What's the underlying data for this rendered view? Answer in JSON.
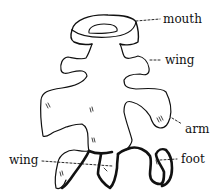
{
  "figure": {
    "colors": {
      "stroke": "#111111",
      "background": "#ffffff"
    },
    "labels": [
      {
        "id": "mouth",
        "text": "mouth",
        "x": 163,
        "y": 13
      },
      {
        "id": "wing_upper",
        "text": "wing",
        "x": 165,
        "y": 54
      },
      {
        "id": "arm",
        "text": "arm",
        "x": 185,
        "y": 123
      },
      {
        "id": "wing_lower",
        "text": "wing",
        "x": 9,
        "y": 156
      },
      {
        "id": "foot",
        "text": "foot",
        "x": 181,
        "y": 153
      }
    ]
  }
}
